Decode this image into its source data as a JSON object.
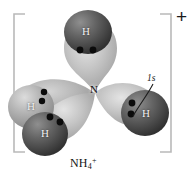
{
  "figure": {
    "title_formula": "NH",
    "formula_subscript": "4",
    "formula_superscript": "+",
    "overall_charge": "+",
    "center_atom_label": "N",
    "orbital_callout_label": "1s",
    "hydrogen_label": "H",
    "background_color": "#ffffff",
    "bracket_color": "#b9b9b9",
    "lobe_color_light": "#c9c9c9",
    "lobe_color_mid": "#a8a8a8",
    "sphere_color_dark": "#5a5a5a",
    "sphere_color_light": "#b0b0b0",
    "electron_dot_color": "#0c0c0c"
  },
  "atoms": [
    {
      "id": "nitrogen-center",
      "element": "N",
      "label": "N",
      "role": "central-atom",
      "position": {
        "x": 95,
        "y": 93
      }
    },
    {
      "id": "hydrogen-top",
      "element": "H",
      "label": "H",
      "role": "bonded-hydrogen",
      "shade": "dark",
      "position": {
        "x": 85,
        "y": 30
      }
    },
    {
      "id": "hydrogen-left-back",
      "element": "H",
      "label": "H",
      "role": "bonded-hydrogen",
      "shade": "light",
      "position": {
        "x": 30,
        "y": 106
      }
    },
    {
      "id": "hydrogen-left-front",
      "element": "H",
      "label": "H",
      "role": "bonded-hydrogen",
      "shade": "dark",
      "position": {
        "x": 44,
        "y": 134
      }
    },
    {
      "id": "hydrogen-right",
      "element": "H",
      "label": "H",
      "role": "bonded-hydrogen",
      "shade": "dark",
      "position": {
        "x": 145,
        "y": 113
      }
    }
  ],
  "orbitals": [
    {
      "id": "sp3-lobe-top",
      "type": "sp3",
      "direction": "up"
    },
    {
      "id": "sp3-lobe-left-back",
      "type": "sp3",
      "direction": "left-upper"
    },
    {
      "id": "sp3-lobe-left-front",
      "type": "sp3",
      "direction": "left-lower"
    },
    {
      "id": "sp3-lobe-right",
      "type": "sp3",
      "direction": "right"
    }
  ],
  "electron_pairs": [
    {
      "id": "pair-top",
      "bond": "N-H top",
      "count": 2
    },
    {
      "id": "pair-left-back",
      "bond": "N-H left back",
      "count": 2
    },
    {
      "id": "pair-left-front",
      "bond": "N-H left front",
      "count": 2
    },
    {
      "id": "pair-right",
      "bond": "N-H right",
      "count": 2
    }
  ],
  "callouts": [
    {
      "id": "callout-1s",
      "label": "1s",
      "points_to": "hydrogen-right",
      "meaning": "hydrogen 1s atomic orbital"
    }
  ]
}
